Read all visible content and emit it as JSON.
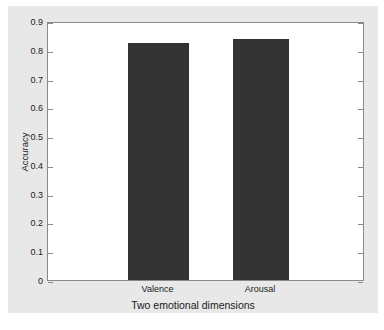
{
  "chart_data": {
    "type": "bar",
    "title": "",
    "xlabel": "Two emotional dimensions",
    "ylabel": "Accuracy",
    "categories": [
      "Valence",
      "Arousal"
    ],
    "values": [
      0.823,
      0.838
    ],
    "ylim": [
      0,
      0.9
    ],
    "yticks": [
      "0",
      "0.1",
      "0.2",
      "0.3",
      "0.4",
      "0.5",
      "0.6",
      "0.7",
      "0.8",
      "0.9"
    ],
    "ytick_values": [
      0,
      0.1,
      0.2,
      0.3,
      0.4,
      0.5,
      0.6,
      0.7,
      0.8,
      0.9
    ],
    "grid": false,
    "legend": null,
    "bar_color": "#333333",
    "plot_background": "#ffffff",
    "figure_background": "#e8e8e8",
    "axis_color": "#8a8a8a"
  }
}
